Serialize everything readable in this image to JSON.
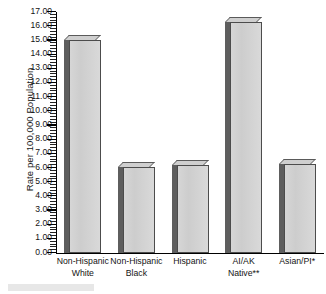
{
  "chart_data": {
    "type": "bar",
    "title": "",
    "subtitle": "",
    "xlabel": "",
    "ylabel": "Rate per 100,000 Population",
    "categories": [
      "Non-Hispanic White",
      "Non-Hispanic Black",
      "Hispanic",
      "AI/AK Native**",
      "Asian/PI*"
    ],
    "category_lines": [
      [
        "Non-Hispanic",
        "White"
      ],
      [
        "Non-Hispanic",
        "Black"
      ],
      [
        "Hispanic"
      ],
      [
        "AI/AK",
        "Native**"
      ],
      [
        "Asian/PI*"
      ]
    ],
    "values": [
      15.0,
      6.1,
      6.2,
      16.3,
      6.3
    ],
    "ylim": [
      0.0,
      17.0
    ],
    "ytick_step": 1.0,
    "ytick_labels": [
      "0.00",
      "1.00",
      "2.00",
      "3.00",
      "4.00",
      "5.00",
      "6.00",
      "7.00",
      "8.00",
      "9.00",
      "10.00",
      "11.00",
      "12.00",
      "13.00",
      "14.00",
      "15.00",
      "16.00",
      "17.00"
    ],
    "minor_ticks_per_interval": 4,
    "grid": false,
    "legend": "none",
    "bar_style": "3d-shadow",
    "colors": {
      "bar_face": "#d4d4d4",
      "bar_side": "#5e5e5e",
      "bar_outline": "#4c4c4c",
      "axis": "#000000",
      "text": "#141414",
      "background": "#ffffff"
    }
  }
}
